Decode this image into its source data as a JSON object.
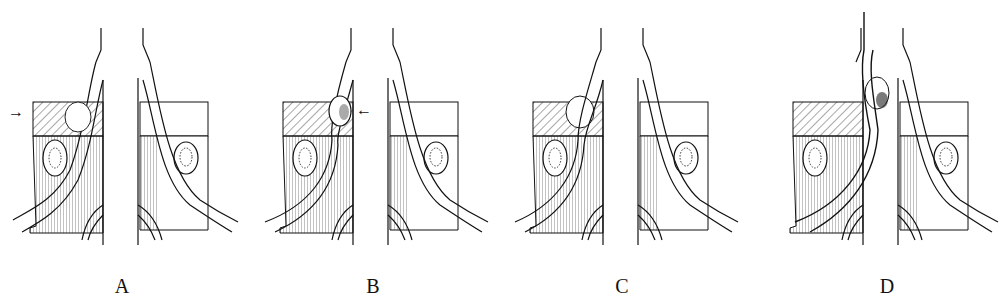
{
  "figure": {
    "background": "#ffffff",
    "line_color": "#111111",
    "panels": [
      {
        "id": "A",
        "label": "A",
        "label_x": 122,
        "offset_x": 0,
        "arrow": "→",
        "arrow_side": "left",
        "arrow_x": 8,
        "arrow_y": 108,
        "herniation": "lateral-under-root"
      },
      {
        "id": "B",
        "label": "B",
        "label_x": 373,
        "offset_x": 250,
        "arrow": "←",
        "arrow_side": "right",
        "arrow_x": 356,
        "arrow_y": 107,
        "herniation": "axillary"
      },
      {
        "id": "C",
        "label": "C",
        "label_x": 622,
        "offset_x": 500,
        "arrow": "",
        "arrow_side": "none",
        "arrow_x": 0,
        "arrow_y": 0,
        "herniation": "root-stretched-over"
      },
      {
        "id": "D",
        "label": "D",
        "label_x": 887,
        "offset_x": 760,
        "arrow": "",
        "arrow_side": "none",
        "arrow_x": 0,
        "arrow_y": 0,
        "herniation": "migrated-with-adhesion"
      }
    ]
  }
}
